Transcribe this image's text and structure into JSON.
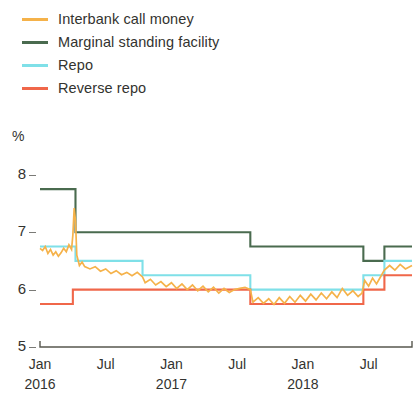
{
  "legend": {
    "position": "top-left",
    "items": [
      {
        "label": "Interbank call money",
        "color": "#F5B24A",
        "key": "call_money"
      },
      {
        "label": "Marginal standing facility",
        "color": "#4A6B4F",
        "key": "msf"
      },
      {
        "label": "Repo",
        "color": "#7FE0E8",
        "key": "repo"
      },
      {
        "label": "Reverse repo",
        "color": "#F0674A",
        "key": "reverse_repo"
      }
    ]
  },
  "axes": {
    "unit": "%",
    "y_ticks": [
      "8",
      "7",
      "6",
      "5"
    ],
    "x_ticks": [
      "Jan",
      "Jul",
      "Jan",
      "Jul",
      "Jan",
      "Jul"
    ],
    "x_years": [
      "2016",
      "",
      "2017",
      "",
      "2018",
      ""
    ]
  },
  "chart_data": {
    "type": "line",
    "title": "",
    "subtitle": "",
    "xlabel": "",
    "ylabel": "%",
    "ylim": [
      5,
      8
    ],
    "xlim": [
      2016.0,
      2018.83
    ],
    "grid": false,
    "y_ticks": [
      8,
      7,
      6,
      5
    ],
    "x_tick_values": [
      2016.0,
      2016.5,
      2017.0,
      2017.5,
      2018.0,
      2018.5
    ],
    "x_tick_labels": [
      "Jan",
      "Jul",
      "Jan",
      "Jul",
      "Jan",
      "Jul"
    ],
    "x_year_labels": [
      "2016",
      "",
      "2017",
      "",
      "2018",
      ""
    ],
    "legend_position": "above-plot-left",
    "series": [
      {
        "name": "Marginal standing facility",
        "key": "msf",
        "color": "#4A6B4F",
        "style": "step",
        "points": [
          [
            2016.0,
            7.75
          ],
          [
            2016.27,
            7.75
          ],
          [
            2016.27,
            7.0
          ],
          [
            2017.6,
            7.0
          ],
          [
            2017.6,
            6.75
          ],
          [
            2018.46,
            6.75
          ],
          [
            2018.46,
            6.5
          ],
          [
            2018.62,
            6.5
          ],
          [
            2018.62,
            6.75
          ],
          [
            2018.83,
            6.75
          ]
        ]
      },
      {
        "name": "Repo",
        "key": "repo",
        "color": "#7FE0E8",
        "style": "step",
        "points": [
          [
            2016.0,
            6.75
          ],
          [
            2016.27,
            6.75
          ],
          [
            2016.27,
            6.5
          ],
          [
            2016.78,
            6.5
          ],
          [
            2016.78,
            6.25
          ],
          [
            2017.6,
            6.25
          ],
          [
            2017.6,
            6.0
          ],
          [
            2018.46,
            6.0
          ],
          [
            2018.46,
            6.25
          ],
          [
            2018.62,
            6.25
          ],
          [
            2018.62,
            6.5
          ],
          [
            2018.83,
            6.5
          ]
        ]
      },
      {
        "name": "Reverse repo",
        "key": "reverse_repo",
        "color": "#F0674A",
        "style": "step",
        "points": [
          [
            2016.0,
            5.75
          ],
          [
            2016.25,
            5.75
          ],
          [
            2016.25,
            6.0
          ],
          [
            2017.6,
            6.0
          ],
          [
            2017.6,
            5.75
          ],
          [
            2018.46,
            5.75
          ],
          [
            2018.46,
            6.0
          ],
          [
            2018.62,
            6.0
          ],
          [
            2018.62,
            6.25
          ],
          [
            2018.83,
            6.25
          ]
        ]
      },
      {
        "name": "Interbank call money",
        "key": "call_money",
        "color": "#F5B24A",
        "style": "noisy-line",
        "points": [
          [
            2016.0,
            6.72
          ],
          [
            2016.02,
            6.68
          ],
          [
            2016.04,
            6.75
          ],
          [
            2016.06,
            6.63
          ],
          [
            2016.08,
            6.7
          ],
          [
            2016.1,
            6.6
          ],
          [
            2016.12,
            6.66
          ],
          [
            2016.14,
            6.58
          ],
          [
            2016.16,
            6.64
          ],
          [
            2016.18,
            6.72
          ],
          [
            2016.2,
            6.66
          ],
          [
            2016.22,
            6.78
          ],
          [
            2016.24,
            6.7
          ],
          [
            2016.25,
            6.95
          ],
          [
            2016.26,
            7.42
          ],
          [
            2016.27,
            7.2
          ],
          [
            2016.28,
            6.6
          ],
          [
            2016.3,
            6.42
          ],
          [
            2016.32,
            6.48
          ],
          [
            2016.34,
            6.4
          ],
          [
            2016.38,
            6.36
          ],
          [
            2016.42,
            6.4
          ],
          [
            2016.46,
            6.32
          ],
          [
            2016.5,
            6.36
          ],
          [
            2016.54,
            6.28
          ],
          [
            2016.58,
            6.33
          ],
          [
            2016.62,
            6.26
          ],
          [
            2016.66,
            6.3
          ],
          [
            2016.7,
            6.24
          ],
          [
            2016.74,
            6.3
          ],
          [
            2016.78,
            6.22
          ],
          [
            2016.8,
            6.12
          ],
          [
            2016.84,
            6.18
          ],
          [
            2016.88,
            6.08
          ],
          [
            2016.92,
            6.14
          ],
          [
            2016.96,
            6.05
          ],
          [
            2017.0,
            6.12
          ],
          [
            2017.04,
            6.02
          ],
          [
            2017.08,
            6.1
          ],
          [
            2017.12,
            6.0
          ],
          [
            2017.16,
            6.08
          ],
          [
            2017.2,
            5.98
          ],
          [
            2017.24,
            6.06
          ],
          [
            2017.28,
            5.96
          ],
          [
            2017.32,
            6.04
          ],
          [
            2017.36,
            5.94
          ],
          [
            2017.4,
            6.02
          ],
          [
            2017.44,
            5.95
          ],
          [
            2017.48,
            6.0
          ],
          [
            2017.52,
            6.02
          ],
          [
            2017.56,
            6.04
          ],
          [
            2017.6,
            6.0
          ],
          [
            2017.62,
            5.78
          ],
          [
            2017.66,
            5.86
          ],
          [
            2017.7,
            5.76
          ],
          [
            2017.74,
            5.84
          ],
          [
            2017.78,
            5.74
          ],
          [
            2017.82,
            5.86
          ],
          [
            2017.86,
            5.76
          ],
          [
            2017.9,
            5.88
          ],
          [
            2017.94,
            5.78
          ],
          [
            2017.98,
            5.9
          ],
          [
            2018.02,
            5.8
          ],
          [
            2018.06,
            5.92
          ],
          [
            2018.1,
            5.82
          ],
          [
            2018.14,
            5.94
          ],
          [
            2018.18,
            5.84
          ],
          [
            2018.22,
            5.96
          ],
          [
            2018.26,
            5.86
          ],
          [
            2018.3,
            6.02
          ],
          [
            2018.34,
            5.9
          ],
          [
            2018.38,
            5.98
          ],
          [
            2018.42,
            5.88
          ],
          [
            2018.45,
            5.94
          ],
          [
            2018.47,
            6.16
          ],
          [
            2018.5,
            6.06
          ],
          [
            2018.53,
            6.2
          ],
          [
            2018.56,
            6.1
          ],
          [
            2018.59,
            6.22
          ],
          [
            2018.62,
            6.34
          ],
          [
            2018.66,
            6.42
          ],
          [
            2018.7,
            6.34
          ],
          [
            2018.74,
            6.44
          ],
          [
            2018.78,
            6.36
          ],
          [
            2018.83,
            6.42
          ]
        ]
      }
    ]
  }
}
